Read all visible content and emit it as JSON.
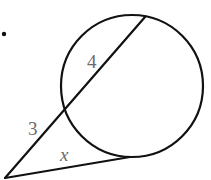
{
  "problem": {
    "marker": "."
  },
  "diagram": {
    "type": "secant-tangent",
    "circle": {
      "cx": 132,
      "cy": 86,
      "r": 71
    },
    "external_point": {
      "x": 5,
      "y": 178
    },
    "secant": {
      "near_intersection": {
        "x": 64,
        "y": 110
      },
      "far_intersection": {
        "x": 145,
        "y": 17
      }
    },
    "tangent_point": {
      "x": 130,
      "y": 157
    },
    "labels": {
      "inner_segment": "4",
      "outer_segment": "3",
      "tangent": "x"
    },
    "colors": {
      "line": "#111111",
      "label": "#6b6b6b"
    }
  }
}
